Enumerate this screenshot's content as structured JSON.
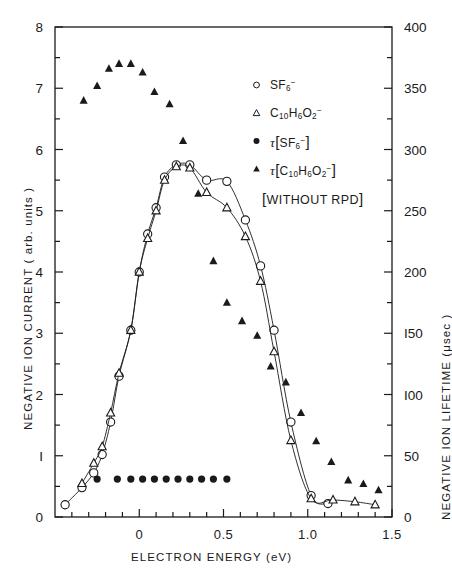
{
  "figure": {
    "plot_area": {
      "x0": 55,
      "y0": 27,
      "x1": 392,
      "y1": 517
    }
  },
  "axes": {
    "x": {
      "title": "ELECTRON ENERGY (eV)",
      "min": -0.5,
      "max": 1.5,
      "major_ticks": [
        0,
        0.5,
        1.0,
        1.5
      ],
      "major_tick_labels": [
        "0",
        "0.5",
        "1.0",
        "1.5"
      ],
      "minor_tick_step": 0.1
    },
    "y_left": {
      "title": "NEGATIVE ION CURRENT ( arb. units )",
      "min": 0,
      "max": 8,
      "major_ticks": [
        0,
        1,
        2,
        3,
        4,
        5,
        6,
        7,
        8
      ],
      "major_tick_labels": [
        "0",
        "I",
        "2",
        "3",
        "4",
        "5",
        "6",
        "7",
        "8"
      ],
      "minor_tick_step": 0.5
    },
    "y_right": {
      "title": "NEGATIVE ION LIFETIME (μsec )",
      "min": 0,
      "max": 400,
      "major_ticks": [
        0,
        50,
        100,
        150,
        200,
        250,
        300,
        350,
        400
      ],
      "major_tick_labels": [
        "0",
        "50",
        "I00",
        "I50",
        "200",
        "250",
        "300",
        "350",
        "400"
      ],
      "minor_tick_step": 25
    }
  },
  "legend": {
    "position": "upper-right-inside",
    "items": [
      {
        "marker": "open-circle",
        "label_html": "SF<sub>6</sub><sup>−</sup>",
        "name": "legend-item-sf6-current"
      },
      {
        "marker": "open-triangle",
        "label_html": "C<sub>10</sub>H<sub>6</sub>O<sub>2</sub><sup>−</sup>",
        "name": "legend-item-c10h6o2-current"
      },
      {
        "marker": "filled-circle",
        "label_html": "<span class='tau'>τ</span><span class='brk'>[</span>SF<sub>6</sub><sup>−</sup><span class='brk'>]</span>",
        "name": "legend-item-tau-sf6"
      },
      {
        "marker": "filled-triangle",
        "label_html": "<span class='tau'>τ</span><span class='brk'>[</span>C<sub>10</sub>H<sub>6</sub>O<sub>2</sub><sup>−</sup><span class='brk'>]</span>",
        "name": "legend-item-tau-c10h6o2"
      }
    ],
    "note": "[WITHOUT RPD]"
  },
  "chart_data": {
    "type": "scatter",
    "title": "",
    "xlabel": "ELECTRON ENERGY (eV)",
    "ylabel": "NEGATIVE ION CURRENT ( arb. units )",
    "y2label": "NEGATIVE ION LIFETIME (μsec )",
    "xlim": [
      -0.5,
      1.5
    ],
    "ylim": [
      0,
      8
    ],
    "y2lim": [
      0,
      400
    ],
    "grid": false,
    "annotations": [
      "[WITHOUT RPD]"
    ],
    "series": [
      {
        "name": "SF6-",
        "marker": "open-circle",
        "line": true,
        "axis": "left",
        "x": [
          -0.44,
          -0.34,
          -0.27,
          -0.22,
          -0.17,
          -0.12,
          -0.05,
          0.0,
          0.05,
          0.1,
          0.15,
          0.22,
          0.3,
          0.4,
          0.52,
          0.63,
          0.72,
          0.8,
          0.9,
          1.02,
          1.12
        ],
        "y": [
          0.2,
          0.48,
          0.72,
          1.02,
          1.55,
          2.3,
          3.05,
          4.0,
          4.62,
          5.05,
          5.55,
          5.75,
          5.75,
          5.5,
          5.48,
          4.85,
          4.1,
          3.05,
          1.55,
          0.35,
          0.22
        ]
      },
      {
        "name": "C10H6O2-",
        "marker": "open-triangle",
        "line": true,
        "axis": "left",
        "x": [
          -0.34,
          -0.27,
          -0.22,
          -0.17,
          -0.12,
          -0.05,
          0.0,
          0.05,
          0.1,
          0.15,
          0.22,
          0.3,
          0.4,
          0.52,
          0.63,
          0.72,
          0.8,
          0.9,
          1.02,
          1.15,
          1.28,
          1.4
        ],
        "y": [
          0.55,
          0.88,
          1.15,
          1.7,
          2.35,
          3.05,
          4.0,
          4.55,
          5.0,
          5.5,
          5.72,
          5.7,
          5.3,
          5.05,
          4.58,
          3.85,
          2.7,
          1.25,
          0.3,
          0.28,
          0.25,
          0.2
        ]
      },
      {
        "name": "tau[SF6-]",
        "marker": "filled-circle",
        "line": false,
        "axis": "right",
        "x": [
          -0.25,
          -0.13,
          -0.05,
          0.02,
          0.09,
          0.16,
          0.23,
          0.3,
          0.37,
          0.44,
          0.52
        ],
        "y": [
          31,
          31,
          31,
          31,
          31,
          31,
          31,
          31,
          31,
          31,
          31
        ]
      },
      {
        "name": "tau[C10H6O2-]",
        "marker": "filled-triangle",
        "line": false,
        "axis": "right",
        "x": [
          -0.33,
          -0.25,
          -0.18,
          -0.12,
          -0.05,
          0.02,
          0.09,
          0.18,
          0.26,
          0.35,
          0.44,
          0.52,
          0.61,
          0.7,
          0.78,
          0.87,
          0.96,
          1.05,
          1.14,
          1.24,
          1.33,
          1.42
        ],
        "y": [
          340,
          352,
          366,
          370,
          370,
          363,
          347,
          337,
          307,
          264,
          209,
          175,
          160,
          148,
          123,
          110,
          85,
          62,
          45,
          30,
          27,
          22
        ]
      }
    ]
  }
}
